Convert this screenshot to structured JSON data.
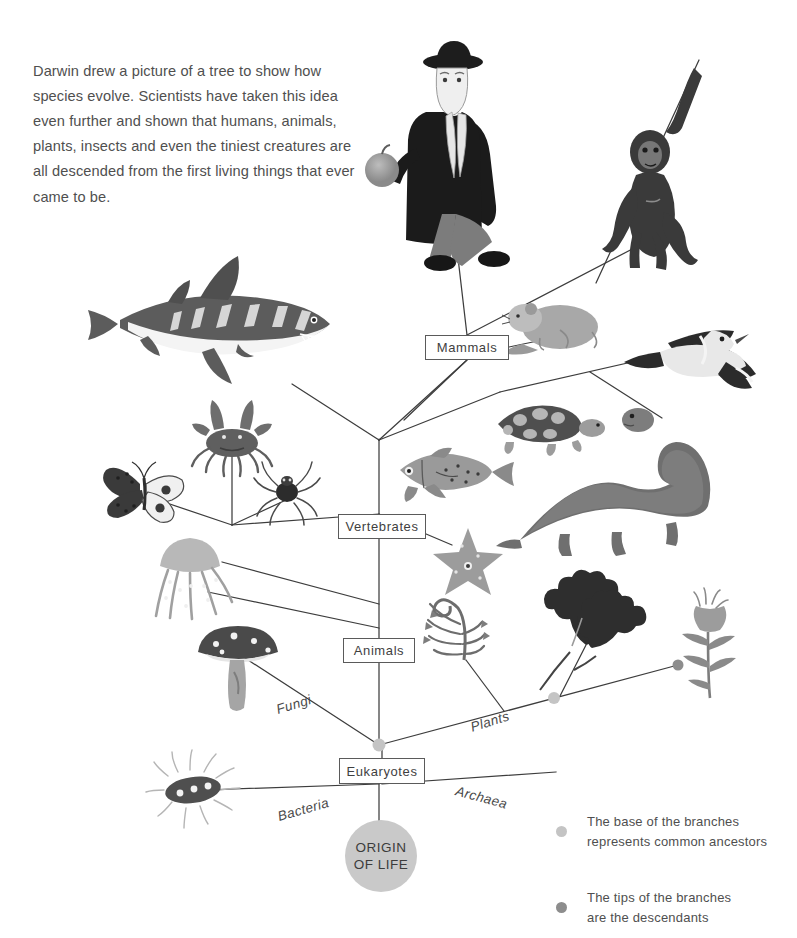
{
  "page": {
    "background": "#ffffff",
    "ink": "#4a4a4a",
    "width": 797,
    "height": 938
  },
  "intro": {
    "text": "Darwin drew a picture of a tree to show how species evolve. Scientists have taken this idea even further and shown that humans, animals, plants, insects and even the tiniest creatures are all descended from the first living things that ever came to be."
  },
  "nodes": {
    "mammals": "Mammals",
    "vertebrates": "Vertebrates",
    "animals": "Animals",
    "eukaryotes": "Eukaryotes"
  },
  "branch_labels": {
    "fungi": "Fungi",
    "plants": "Plants",
    "bacteria": "Bacteria",
    "archaea": "Archaea"
  },
  "origin": {
    "line1": "ORIGIN",
    "line2": "OF LIFE",
    "fill": "#c9c9c9"
  },
  "legend": {
    "items": [
      {
        "dot": "base-node-dot",
        "color": "#c4c4c4",
        "line1": "The base of the branches",
        "line2": "represents common ancestors"
      },
      {
        "dot": "tip-node-dot",
        "color": "#8d8d8d",
        "line1": "The tips of the branches",
        "line2": "are the descendants"
      }
    ]
  },
  "organisms": [
    {
      "name": "darwin-figure",
      "label": "Darwin"
    },
    {
      "name": "chimpanzee",
      "label": "Chimpanzee"
    },
    {
      "name": "shark",
      "label": "Shark"
    },
    {
      "name": "mouse",
      "label": "Mouse"
    },
    {
      "name": "bird",
      "label": "Bird"
    },
    {
      "name": "crab",
      "label": "Crab"
    },
    {
      "name": "butterfly",
      "label": "Butterfly"
    },
    {
      "name": "spider",
      "label": "Spider"
    },
    {
      "name": "fish",
      "label": "Fish"
    },
    {
      "name": "turtle",
      "label": "Turtle"
    },
    {
      "name": "dinosaur",
      "label": "Dinosaur"
    },
    {
      "name": "starfish",
      "label": "Starfish"
    },
    {
      "name": "jellyfish",
      "label": "Jellyfish"
    },
    {
      "name": "mushroom",
      "label": "Mushroom"
    },
    {
      "name": "fern",
      "label": "Fern"
    },
    {
      "name": "oak-leaves",
      "label": "Oak leaves"
    },
    {
      "name": "flower",
      "label": "Flower"
    },
    {
      "name": "bacterium",
      "label": "Bacterium"
    }
  ]
}
